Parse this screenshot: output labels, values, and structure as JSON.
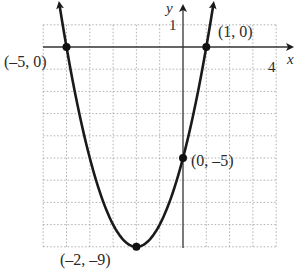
{
  "chart_data": {
    "type": "line",
    "title": "",
    "function": "y = x^2 + 4x - 5",
    "xlabel": "x",
    "ylabel": "y",
    "xlim": [
      -6,
      4
    ],
    "ylim": [
      -9,
      1
    ],
    "grid": true,
    "tick_labels": {
      "x": [
        "4"
      ],
      "y": [
        "1"
      ]
    },
    "points": [
      {
        "x": -5,
        "y": 0,
        "label": "(–5, 0)"
      },
      {
        "x": 1,
        "y": 0,
        "label": "(1, 0)"
      },
      {
        "x": 0,
        "y": -5,
        "label": "(0, –5)"
      },
      {
        "x": -2,
        "y": -9,
        "label": "(–2, –9)"
      }
    ],
    "colors": {
      "curve": "#1a1a1a",
      "grid": "#9a9a9a",
      "axes": "#333333"
    }
  },
  "labels": {
    "x_axis": "x",
    "y_axis": "y",
    "x_tick": "4",
    "y_tick": "1",
    "p1": "(–5, 0)",
    "p2": "(1, 0)",
    "p3": "(0, –5)",
    "p4": "(–2, –9)"
  }
}
